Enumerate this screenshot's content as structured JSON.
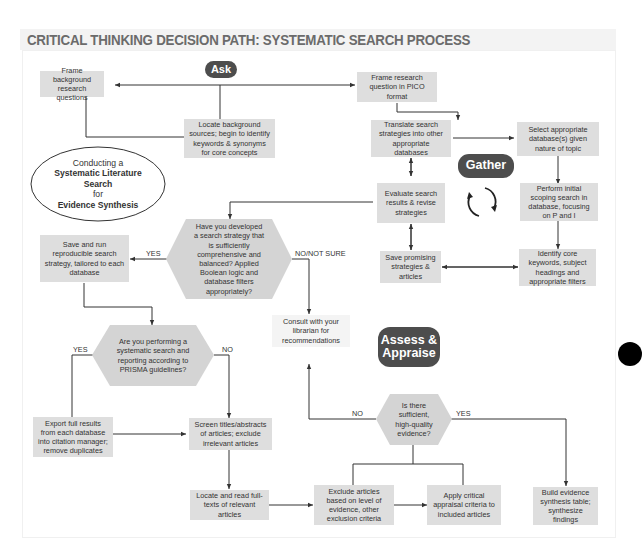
{
  "title": "CRITICAL THINKING DECISION PATH: SYSTEMATIC SEARCH PROCESS",
  "phases": {
    "ask": "Ask",
    "gather": "Gather",
    "assess_line1": "Assess &",
    "assess_line2": "Appraise"
  },
  "center_ellipse": {
    "line1": "Conducting a",
    "line2": "Systematic Literature",
    "line3": "Search",
    "line4": "for",
    "line5": "Evidence Synthesis"
  },
  "boxes": {
    "frame_background": "Frame background research questions",
    "frame_pico": "Frame research question in PICO format",
    "locate_background": "Locate background sources; begin to identify keywords & synonyms for core concepts",
    "translate_strategies": "Translate search strategies into other appropriate databases",
    "select_databases": "Select appropriate database(s) given nature of topic",
    "evaluate_results": "Evaluate search results & revise strategies",
    "perform_scoping": "Perform initial scoping search in database, focusing on P and I",
    "save_promising": "Save promising strategies & articles",
    "identify_keywords": "Identify core keywords, subject headings and appropriate filters",
    "save_and_run": "Save and run reproducible search strategy, tailored to each database",
    "consult_librarian": "Consult with your librarian for recommendations",
    "export_results": "Export full results from each database into citation manager; remove duplicates",
    "screen_titles": "Screen titles/abstracts of articles; exclude irrelevant articles",
    "locate_fulltexts": "Locate and read full-texts of relevant articles",
    "exclude_articles": "Exclude articles based on level of evidence, other exclusion criteria",
    "apply_appraisal": "Apply critical appraisal criteria to included articles",
    "build_table": "Build evidence synthesis table; synthesize findings"
  },
  "decisions": {
    "strategy_developed": "Have you developed a search strategy that is sufficiently comprehensive and balanced? Applied Boolean logic and database filters appropriately?",
    "prisma": "Are you performing a systematic search and reporting according to PRISMA guidelines?",
    "sufficient_evidence": "Is there sufficient, high-quality evidence?"
  },
  "edge_labels": {
    "strategy_yes": "YES",
    "strategy_no": "NO/NOT SURE",
    "prisma_yes": "YES",
    "prisma_no": "NO",
    "evidence_no": "NO",
    "evidence_yes": "YES"
  },
  "icons": {
    "cycle": "cycle-arrows-icon"
  },
  "colors": {
    "box_fill": "#dedede",
    "pill_fill": "#4d4d4d",
    "title_text": "#6b6b6b",
    "line": "#333333"
  }
}
